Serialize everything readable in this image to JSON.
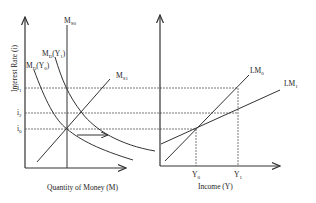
{
  "left_chart": {
    "y_axis_label": "Interest Rate (i)",
    "x_axis_label": "Quantity of Money (M)",
    "ms0_label": "M",
    "ms0_sub": "S0",
    "ms1_label": "M",
    "ms1_sub": "S1",
    "md0_label": "M",
    "md0_sub": "D",
    "md0_arg": "(Y",
    "md0_arg_sub": "0",
    "md0_close": ")",
    "md1_label": "M",
    "md1_sub": "D",
    "md1_arg": "(Y",
    "md1_arg_sub": "1",
    "md1_close": ")",
    "i1_label": "i",
    "i1_sub": "1",
    "i2_label": "i",
    "i2_sub": "2",
    "i0_label": "i",
    "i0_sub": "0"
  },
  "right_chart": {
    "x_axis_label": "Income (Y)",
    "lm0_label": "LM",
    "lm0_sub": "0",
    "lm1_label": "LM",
    "lm1_sub": "1",
    "y0_label": "Y",
    "y0_sub": "0",
    "y1_label": "Y",
    "y1_sub": "1"
  }
}
